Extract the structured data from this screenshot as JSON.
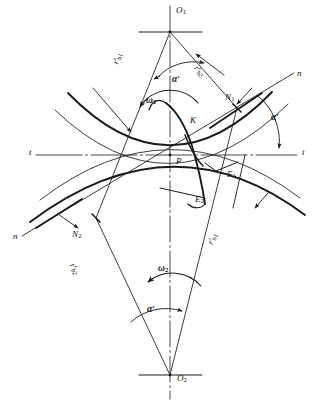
{
  "figure": {
    "type": "engineering-line-diagram",
    "background_color": "#ffffff",
    "line_color": "#1a1a1a",
    "width": 323,
    "height": 405
  },
  "labels": {
    "center_top": {
      "text": "O",
      "sub": "1",
      "x": 176,
      "y": 8
    },
    "center_bottom": {
      "text": "O",
      "sub": "2",
      "x": 177,
      "y": 375
    },
    "pitch_point": {
      "text": "P",
      "sub": "",
      "x": 176,
      "y": 157
    },
    "contact_point_k": {
      "text": "K",
      "sub": "",
      "x": 190,
      "y": 117
    },
    "point_n1": {
      "text": "N",
      "sub": "1",
      "x": 226,
      "y": 94
    },
    "point_n2": {
      "text": "N",
      "sub": "2",
      "x": 73,
      "y": 231
    },
    "point_e1": {
      "text": "E",
      "sub": "1",
      "x": 227,
      "y": 171
    },
    "point_e2": {
      "text": "E",
      "sub": "2",
      "x": 196,
      "y": 196
    },
    "base_radius_1": {
      "text": "r",
      "prime": "'",
      "sub": "b1",
      "x": 112,
      "y": 64
    },
    "base_radius_2_top": {
      "text": "r",
      "prime": "'",
      "sub": "b2",
      "x": 199,
      "y": 66
    },
    "base_radius_2_bottom": {
      "text": "r",
      "prime": "'",
      "sub": "b2",
      "x": 77,
      "y": 263
    },
    "base_radius_1_bottom": {
      "text": "r",
      "prime": "'",
      "sub": "b1",
      "x": 206,
      "y": 243
    },
    "omega_1": {
      "text": "ω",
      "sub": "1",
      "x": 146,
      "y": 97
    },
    "omega_2": {
      "text": "ω",
      "sub": "2",
      "x": 158,
      "y": 265
    },
    "alpha_top": {
      "text": "α",
      "prime": "'",
      "x": 172,
      "y": 76
    },
    "alpha_right": {
      "text": "α",
      "prime": "'",
      "x": 271,
      "y": 114
    },
    "alpha_bottom": {
      "text": "α",
      "prime": "'",
      "x": 147,
      "y": 306
    },
    "tangent_left": {
      "text": "t",
      "x": 29,
      "y": 148
    },
    "tangent_right": {
      "text": "t",
      "x": 302,
      "y": 148
    },
    "normal_right": {
      "text": "n",
      "x": 297,
      "y": 70
    },
    "normal_left": {
      "text": "n",
      "x": 14,
      "y": 233
    }
  },
  "geometry": {
    "center_line_x": 170,
    "pitch_line_y": 155,
    "apex_top": {
      "x": 170,
      "y": 32
    },
    "apex_bottom": {
      "x": 170,
      "y": 375
    },
    "pitch_point": {
      "x": 170,
      "y": 155
    },
    "n1": {
      "x": 237,
      "y": 108
    },
    "n2": {
      "x": 96,
      "y": 218
    },
    "pressure_angle_deg": 20
  }
}
